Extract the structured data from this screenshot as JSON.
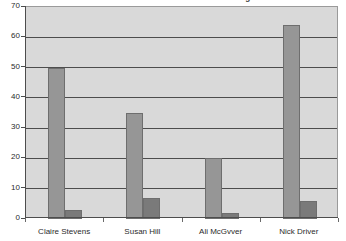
{
  "chart_data": {
    "type": "bar",
    "title": "Candidates Test Scores at Interview Stages",
    "xlabel": "",
    "ylabel": "",
    "ylim": [
      0,
      70
    ],
    "ytick_step": 10,
    "yticks": [
      0,
      10,
      20,
      30,
      40,
      50,
      60,
      70
    ],
    "ytick_labels": [
      "0",
      "10",
      "20",
      "30",
      "40",
      "50",
      "60",
      "70"
    ],
    "categories": [
      "Claire Stevens",
      "Susan Hill",
      "Ali McGvver",
      "Nick Driver"
    ],
    "series": [
      {
        "name": "Series 1",
        "color": "#969696",
        "values": [
          50,
          35,
          20,
          64
        ]
      },
      {
        "name": "Series 2",
        "color": "#7a7a7a",
        "values": [
          3,
          7,
          2,
          6
        ]
      }
    ],
    "grid": true,
    "grid_axis": "y",
    "legend": false,
    "plot_background": "#d9d9d9",
    "grid_color": "#4d4d4d",
    "axis_color": "#4d4d4d",
    "text_color": "#2b2b2b"
  }
}
